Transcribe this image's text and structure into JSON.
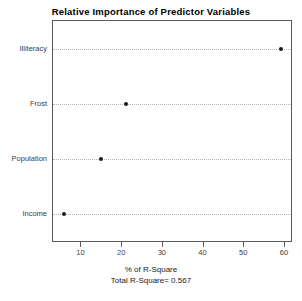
{
  "chart_data": {
    "type": "scatter",
    "title": "Relative Importance of Predictor Variables",
    "xlabel": "% of R-Square",
    "sublabel": "Total R-Square= 0.567",
    "ylabel": "",
    "categories": [
      "Income",
      "Population",
      "Frost",
      "Illiteracy"
    ],
    "values": [
      5.6,
      14.9,
      21.0,
      59.0
    ],
    "xlim": [
      3.0,
      61.5
    ],
    "xticks": [
      10,
      20,
      30,
      40,
      50,
      60
    ],
    "xtick_labels": [
      "10",
      "20",
      "30",
      "40",
      "50",
      "60"
    ],
    "grid": true,
    "grid_style": "dotted-horizontal",
    "legend": "none",
    "marker": "filled-circle",
    "marker_color": "#1a1a1a",
    "frame_color": "#5a5a5a",
    "grid_color": "#b4b4b4",
    "background": "#ffffff"
  }
}
